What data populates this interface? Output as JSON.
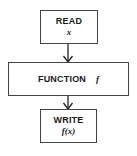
{
  "diagram": {
    "type": "flowchart",
    "nodes": [
      {
        "id": "read",
        "label": "READ",
        "sub": "x"
      },
      {
        "id": "function",
        "label": "FUNCTION",
        "sub": "f"
      },
      {
        "id": "write",
        "label": "WRITE",
        "sub": "f(x)"
      }
    ],
    "edges": [
      {
        "from": "read",
        "to": "function"
      },
      {
        "from": "function",
        "to": "write"
      }
    ],
    "colors": {
      "stroke": "#444444",
      "text": "#1a1a1a",
      "background": "#ffffff"
    }
  }
}
